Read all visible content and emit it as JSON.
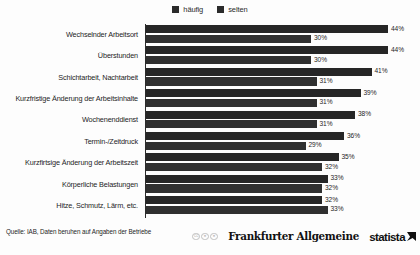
{
  "legend": {
    "items": [
      {
        "label": "häufig",
        "color": "#2b2b2b"
      },
      {
        "label": "selten",
        "color": "#303030"
      }
    ]
  },
  "footer": {
    "source": "Quelle: IAB, Daten beruhen auf Angaben der Betriebe",
    "cc_badges": [
      "CC",
      "ⓘ",
      "⊙"
    ],
    "publisher": "Frankfurter Allgemeine",
    "provider": "statista"
  },
  "chart_data": {
    "type": "bar",
    "orientation": "horizontal",
    "title": "",
    "xlabel": "",
    "ylabel": "",
    "xlim": [
      0,
      50
    ],
    "grid": false,
    "legend_position": "top-center",
    "value_suffix": "%",
    "categories": [
      "Wechselnder Arbeitsort",
      "Überstunden",
      "Schichtarbeit, Nachtarbeit",
      "Kurzfristige Änderung der Arbeitsinhalte",
      "Wochenenddienst",
      "Termin-/Zeitdruck",
      "Kurzfirtsige Änderung der Arbeitszeit",
      "Körperliche Belastungen",
      "Hitze, Schmutz, Lärm, etc."
    ],
    "series": [
      {
        "name": "häufig",
        "values": [
          44,
          44,
          41,
          39,
          38,
          36,
          35,
          33,
          32
        ],
        "labels": [
          "44%",
          "44%",
          "41%",
          "39%",
          "38%",
          "36%",
          "35%",
          "33%",
          "32%"
        ]
      },
      {
        "name": "selten",
        "values": [
          30,
          30,
          31,
          31,
          31,
          29,
          32,
          32,
          33
        ],
        "labels": [
          "30%",
          "30%",
          "31%",
          "31%",
          "31%",
          "29%",
          "32%",
          "32%",
          "33%"
        ]
      }
    ]
  }
}
